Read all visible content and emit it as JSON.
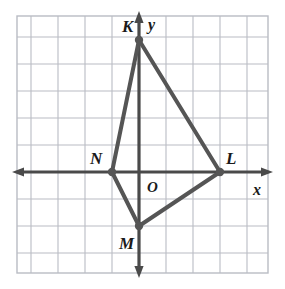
{
  "figure": {
    "background_color": "#ffffff",
    "grid_color": "#b9bcc4",
    "axis_color": "#4a4a4a",
    "shape_color": "#555555",
    "label_color": "#1a1a1a"
  },
  "axes": {
    "x_label": "x",
    "y_label": "y",
    "origin_label": "O",
    "origin_px": {
      "x": 139,
      "y": 172
    },
    "cell_px": 27,
    "x_range": [
      -4.4,
      4.8
    ],
    "y_range": [
      -3.8,
      5.8
    ]
  },
  "grid": {
    "left_px": 17,
    "top_px": 16,
    "right_px": 268,
    "bottom_px": 273,
    "cols": 9,
    "rows": 9,
    "show_grid": true
  },
  "chart_data": {
    "type": "scatter",
    "xlabel": "x",
    "ylabel": "y",
    "xlim": [
      -4.4,
      4.8
    ],
    "ylim": [
      -3.8,
      5.8
    ],
    "grid": true,
    "legend": "none",
    "points": [
      {
        "label": "K",
        "x": 0,
        "y": 5,
        "px": 139,
        "py": 40,
        "label_px": 122,
        "label_py": 18
      },
      {
        "label": "L",
        "x": 3,
        "y": 0,
        "px": 220,
        "py": 172,
        "label_px": 226,
        "label_py": 150
      },
      {
        "label": "M",
        "x": 0,
        "y": -2,
        "px": 139,
        "py": 226,
        "label_px": 119,
        "label_py": 235
      },
      {
        "label": "N",
        "x": -1,
        "y": 0,
        "px": 112,
        "py": 172,
        "label_px": 90,
        "label_py": 150
      }
    ],
    "polygon": [
      "K",
      "L",
      "M",
      "N"
    ],
    "annotations": [
      "O"
    ]
  }
}
